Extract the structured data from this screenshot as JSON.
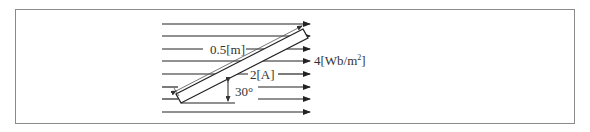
{
  "diagram": {
    "type": "conductor-in-magnetic-field",
    "field_lines": {
      "count": 8,
      "direction": "right"
    },
    "conductor": {
      "length_label": "0.5[m]",
      "current_label": "2[A]",
      "angle_label": "30°"
    },
    "field_label": {
      "value": "4",
      "unit_prefix": "[Wb/m",
      "unit_exp": "2",
      "unit_suffix": "]"
    },
    "colors": {
      "line": "#222222",
      "frame": "#8a8a8a",
      "text": "#333333"
    }
  }
}
